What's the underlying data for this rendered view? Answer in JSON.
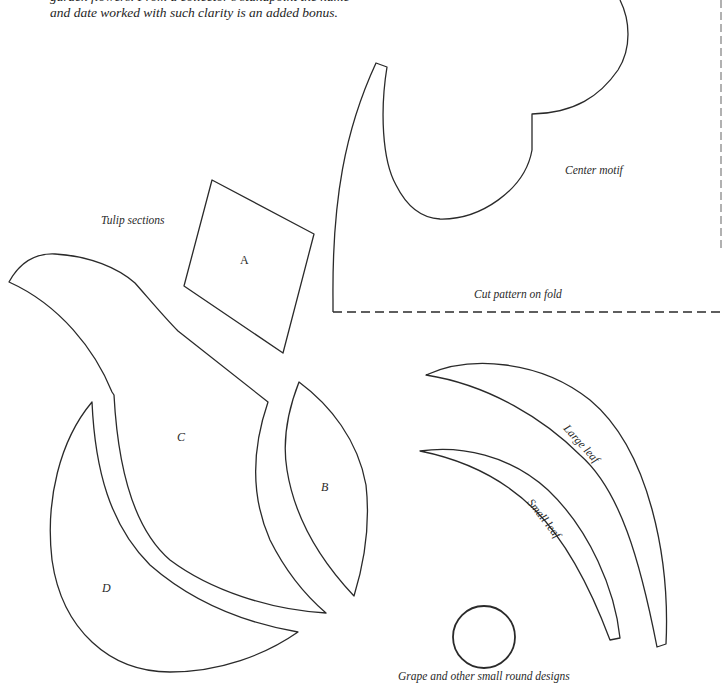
{
  "intro_text": {
    "line1": "garden flowers. From a collector's standpoint the name",
    "line2": "and date worked with such clarity is an added bonus."
  },
  "labels": {
    "center_motif": "Center motif",
    "cut_pattern": "Cut pattern on fold",
    "tulip_sections": "Tulip sections",
    "large_leaf": "Large leaf",
    "small_leaf": "Small leaf",
    "grape": "Grape and other small round designs"
  },
  "section_letters": {
    "a": "A",
    "b": "B",
    "c": "C",
    "d": "D"
  },
  "colors": {
    "line": "#2a2a2a",
    "background": "#ffffff"
  }
}
